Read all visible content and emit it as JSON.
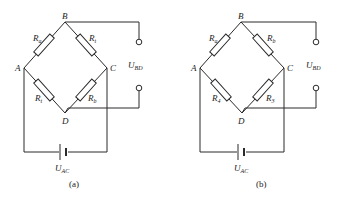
{
  "figures": [
    {
      "id": "a",
      "caption": "(a)",
      "nodes": {
        "A": "A",
        "B": "B",
        "C": "C",
        "D": "D"
      },
      "resistors": {
        "AB": {
          "main": "R",
          "sub": "a"
        },
        "BC": {
          "main": "R",
          "sub": "t"
        },
        "AD": {
          "main": "R",
          "sub": "t"
        },
        "CD": {
          "main": "R",
          "sub": "b"
        }
      },
      "output_voltage": {
        "main": "U",
        "sub": "BD"
      },
      "supply_voltage": {
        "main": "U",
        "sub": "AC"
      }
    },
    {
      "id": "b",
      "caption": "(b)",
      "nodes": {
        "A": "A",
        "B": "B",
        "C": "C",
        "D": "D"
      },
      "resistors": {
        "AB": {
          "main": "R",
          "sub": "a"
        },
        "BC": {
          "main": "R",
          "sub": "b"
        },
        "AD": {
          "main": "R",
          "sub": "4"
        },
        "CD": {
          "main": "R",
          "sub": "3"
        }
      },
      "output_voltage": {
        "main": "U",
        "sub": "BD"
      },
      "supply_voltage": {
        "main": "U",
        "sub": "AC"
      }
    }
  ]
}
